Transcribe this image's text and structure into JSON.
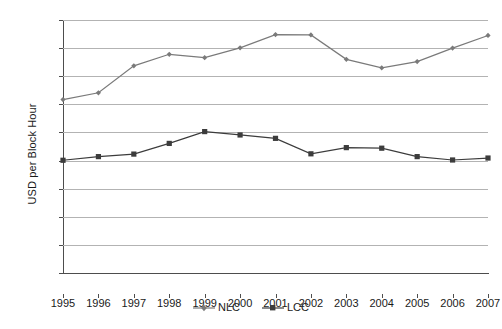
{
  "chart_data": {
    "type": "line",
    "title": "",
    "xlabel": "",
    "ylabel": "USD per Block Hour",
    "x": [
      1995,
      1996,
      1997,
      1998,
      1999,
      2000,
      2001,
      2002,
      2003,
      2004,
      2005,
      2006,
      2007
    ],
    "categories": [
      "1995",
      "1996",
      "1997",
      "1998",
      "1999",
      "2000",
      "2001",
      "2002",
      "2003",
      "2004",
      "2005",
      "2006",
      "2007"
    ],
    "series": [
      {
        "name": "NLC",
        "marker": "diamond",
        "color": "#7a7a7a",
        "values": [
          617,
          641,
          737,
          778,
          766,
          801,
          848,
          847,
          760,
          730,
          752,
          800,
          845
        ]
      },
      {
        "name": "LCC",
        "marker": "square",
        "color": "#3c3c3c",
        "values": [
          401,
          414,
          423,
          461,
          503,
          491,
          479,
          424,
          446,
          444,
          414,
          402,
          409
        ]
      }
    ],
    "ylim": [
      0,
      900
    ],
    "y_ticks": [
      0,
      100,
      200,
      300,
      400,
      500,
      600,
      700,
      800,
      900
    ],
    "y_tick_labels": [
      "-",
      "100",
      "200",
      "300",
      "400",
      "500",
      "600",
      "700",
      "800",
      "900"
    ],
    "xlim": [
      1995,
      2007
    ],
    "grid": "horizontal",
    "legend_position": "bottom-center",
    "legend": [
      "NLC",
      "LCC"
    ],
    "background_color": "#ffffff",
    "gridline_color": "#b3b3b3",
    "axis_color": "#4d4d4d"
  }
}
